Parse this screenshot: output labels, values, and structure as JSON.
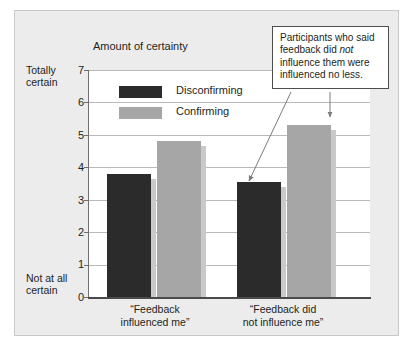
{
  "figure": {
    "panel_bg": "#ececed",
    "plot_bg": "#ffffff"
  },
  "chart_data": {
    "type": "bar",
    "title": "",
    "axis_title": "Amount of certainty",
    "xlabel": "",
    "ylabel": "Amount of certainty",
    "ylim": [
      0,
      7
    ],
    "yticks": [
      0,
      1,
      2,
      3,
      4,
      5,
      6,
      7
    ],
    "ytick_labels": [
      "0",
      "1",
      "2",
      "3",
      "4",
      "5",
      "6",
      "7"
    ],
    "y_axis_top_label": "Totally\ncertain",
    "y_axis_bottom_label": "Not at all\ncertain",
    "grid": true,
    "legend_position": "inside-top-left",
    "categories": [
      "“Feedback\ninfluenced me”",
      "“Feedback did\nnot influence me”"
    ],
    "series": [
      {
        "name": "Disconfirming",
        "color": "#2b2b2b",
        "values": [
          3.8,
          3.55
        ]
      },
      {
        "name": "Confirming",
        "color": "#a6a6a6",
        "values": [
          4.8,
          5.3
        ]
      }
    ],
    "annotations": [
      {
        "text": "Participants who said feedback did not influence them were influenced no less.",
        "points_to": [
          "Disconfirming / “Feedback did not influence me”",
          "Confirming / “Feedback did not influence me”"
        ]
      }
    ]
  },
  "axis": {
    "title": "Amount of certainty",
    "top_label_line1": "Totally",
    "top_label_line2": "certain",
    "bottom_label_line1": "Not at all",
    "bottom_label_line2": "certain",
    "ticks": [
      "7",
      "6",
      "5",
      "4",
      "3",
      "2",
      "1",
      "0"
    ]
  },
  "legend": {
    "items": [
      {
        "label": "Disconfirming",
        "color": "#2b2b2b"
      },
      {
        "label": "Confirming",
        "color": "#a6a6a6"
      }
    ]
  },
  "categories": [
    {
      "line1": "“Feedback",
      "line2": "influenced me”"
    },
    {
      "line1": "“Feedback did",
      "line2": "not influence me”"
    }
  ],
  "callout": {
    "part1": "Participants who said feedback did ",
    "emphasis": "not",
    "part2": " influence them were influenced no less."
  }
}
